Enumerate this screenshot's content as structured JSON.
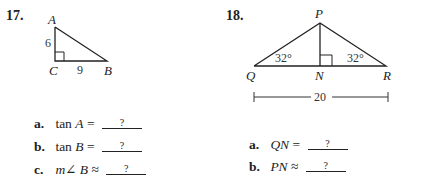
{
  "problems": [
    {
      "number": "17.",
      "figure": {
        "type": "right-triangle",
        "vertices": {
          "A": "A",
          "B": "B",
          "C": "C"
        },
        "side_AC": "6",
        "side_CB": "9",
        "right_angle_at": "C"
      },
      "questions": [
        {
          "letter": "a.",
          "func": "tan",
          "var": "A",
          "op": "=",
          "answer": "?"
        },
        {
          "letter": "b.",
          "func": "tan",
          "var": "B",
          "op": "=",
          "answer": "?"
        },
        {
          "letter": "c.",
          "func": "m∠",
          "var": "B",
          "op": "≈",
          "answer": "?"
        }
      ]
    },
    {
      "number": "18.",
      "figure": {
        "type": "isosceles-triangle-with-altitude",
        "vertices": {
          "P": "P",
          "Q": "Q",
          "N": "N",
          "R": "R"
        },
        "angle_Q": "32°",
        "angle_R": "32°",
        "base_length": "20",
        "right_angle_at": "N"
      },
      "questions": [
        {
          "letter": "a.",
          "var": "QN",
          "op": "=",
          "answer": "?"
        },
        {
          "letter": "b.",
          "var": "PN",
          "op": "≈",
          "answer": "?"
        }
      ]
    }
  ],
  "colors": {
    "ink": "#222222",
    "background": "#ffffff"
  }
}
